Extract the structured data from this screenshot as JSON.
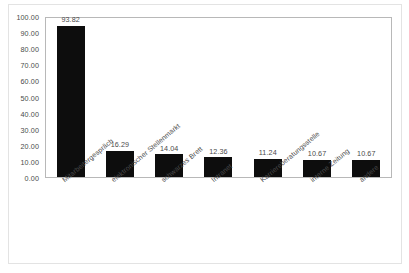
{
  "chart_data": {
    "type": "bar",
    "title": "",
    "subtitle": "",
    "xlabel": "",
    "ylabel": "",
    "ylim": [
      0,
      100
    ],
    "ytick_labels": [
      "100.00",
      "90.00",
      "80.00",
      "70.00",
      "60.00",
      "50.00",
      "40.00",
      "30.00",
      "20.00",
      "10.00",
      "0.00"
    ],
    "ytick_values": [
      100,
      90,
      80,
      70,
      60,
      50,
      40,
      30,
      20,
      10,
      0
    ],
    "grid": false,
    "legend": false,
    "legend_position": "none",
    "bar_color": "#0d0d0d",
    "categories": [
      "Mitarbeitergespräch",
      "elektronischer Stellenmarkt",
      "schwarzes Brett",
      "Intranet",
      "Karriereberatungsstelle",
      "interne Zeitung",
      "andere"
    ],
    "values": [
      93.82,
      16.29,
      14.04,
      12.36,
      11.24,
      10.67,
      10.67
    ],
    "data_labels": [
      "93.82",
      "16.29",
      "14.04",
      "12.36",
      "11.24",
      "10.67",
      "10.67"
    ]
  }
}
